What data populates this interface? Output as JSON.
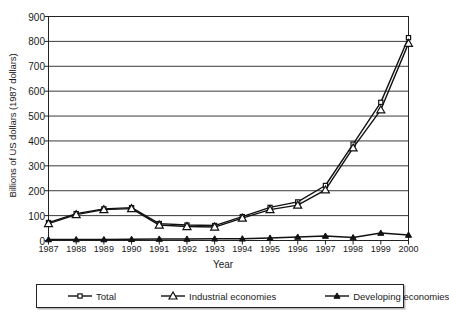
{
  "chart_data": {
    "type": "line",
    "title": "",
    "xlabel": "Year",
    "ylabel": "Billions of US dollars (1987 dollars)",
    "categories": [
      "1987",
      "1988",
      "1989",
      "1990",
      "1991",
      "1992",
      "1993",
      "1994",
      "1995",
      "1996",
      "1997",
      "1998",
      "1999",
      "2000"
    ],
    "ylim": [
      0,
      900
    ],
    "yticks": [
      0,
      100,
      200,
      300,
      400,
      500,
      600,
      700,
      800,
      900
    ],
    "grid": true,
    "legend_position": "bottom",
    "series": [
      {
        "name": "Total",
        "marker": "open-square",
        "values": [
          72,
          108,
          127,
          132,
          68,
          62,
          60,
          96,
          133,
          155,
          221,
          387,
          555,
          815
        ]
      },
      {
        "name": "Industrial economies",
        "marker": "open-triangle",
        "values": [
          68,
          104,
          124,
          128,
          62,
          56,
          54,
          90,
          124,
          142,
          203,
          372,
          525,
          792
        ]
      },
      {
        "name": "Developing economies",
        "marker": "filled-triangle",
        "values": [
          4,
          4,
          4,
          5,
          6,
          6,
          7,
          7,
          10,
          14,
          18,
          12,
          30,
          22
        ]
      }
    ]
  },
  "axis": {
    "y_tick_labels": [
      "900",
      "800",
      "700",
      "600",
      "500",
      "400",
      "300",
      "200",
      "100",
      "0"
    ],
    "x_tick_labels": [
      "1987",
      "1988",
      "1989",
      "1990",
      "1991",
      "1992",
      "1993",
      "1994",
      "1995",
      "1996",
      "1997",
      "1998",
      "1999",
      "2000"
    ],
    "y_axis_title": "Billions of US dollars (1987 dollars)",
    "x_axis_title": "Year"
  },
  "legend": {
    "items": [
      {
        "label": "Total",
        "marker": "open-square"
      },
      {
        "label": "Industrial economies",
        "marker": "open-triangle"
      },
      {
        "label": "Developing economies",
        "marker": "filled-triangle"
      }
    ]
  },
  "colors": {
    "line": "#111111",
    "grid": "#3a3a3a",
    "frame": "#222222",
    "background": "#ffffff",
    "text": "#1a1a1a"
  }
}
